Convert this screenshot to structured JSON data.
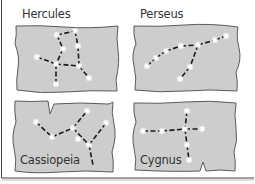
{
  "figure": {
    "panel_fill": "#cdcdcd",
    "panel_stroke": "#5a5a5a",
    "star_color": "#ffffff",
    "line_color": "#1a1a1a"
  },
  "constellations": [
    {
      "name": "Hercules",
      "stars": [
        [
          57,
          35
        ],
        [
          75,
          31
        ],
        [
          63,
          49
        ],
        [
          78,
          46
        ],
        [
          37,
          57
        ],
        [
          56,
          64
        ],
        [
          79,
          66
        ],
        [
          89,
          78
        ],
        [
          56,
          84
        ]
      ],
      "links": [
        [
          0,
          1
        ],
        [
          0,
          2
        ],
        [
          1,
          3
        ],
        [
          2,
          5
        ],
        [
          4,
          5
        ],
        [
          5,
          6
        ],
        [
          3,
          6
        ],
        [
          6,
          7
        ],
        [
          5,
          8
        ]
      ]
    },
    {
      "name": "Perseus",
      "stars": [
        [
          147,
          66
        ],
        [
          156,
          58
        ],
        [
          166,
          51
        ],
        [
          181,
          46
        ],
        [
          198,
          45
        ],
        [
          215,
          40
        ],
        [
          226,
          36
        ],
        [
          190,
          67
        ],
        [
          180,
          79
        ]
      ],
      "links": [
        [
          0,
          1
        ],
        [
          1,
          2
        ],
        [
          2,
          3
        ],
        [
          3,
          4
        ],
        [
          4,
          5
        ],
        [
          5,
          6
        ],
        [
          4,
          7
        ],
        [
          7,
          8
        ]
      ]
    },
    {
      "name": "Cassiopeia",
      "stars": [
        [
          36,
          122
        ],
        [
          52,
          137
        ],
        [
          73,
          128
        ],
        [
          87,
          111
        ],
        [
          78,
          139
        ],
        [
          89,
          145
        ],
        [
          106,
          123
        ]
      ],
      "links": [
        [
          0,
          1
        ],
        [
          1,
          2
        ],
        [
          2,
          3
        ],
        [
          2,
          5
        ],
        [
          5,
          6
        ],
        [
          5,
          "tail"
        ]
      ]
    },
    {
      "name": "Cygnus",
      "stars": [
        [
          187,
          111
        ],
        [
          143,
          131
        ],
        [
          162,
          131
        ],
        [
          185,
          129
        ],
        [
          202,
          129
        ],
        [
          187,
          145
        ],
        [
          189,
          160
        ]
      ],
      "links": [
        [
          0,
          3
        ],
        [
          1,
          2
        ],
        [
          2,
          3
        ],
        [
          3,
          4
        ],
        [
          3,
          5
        ],
        [
          5,
          6
        ]
      ]
    }
  ]
}
